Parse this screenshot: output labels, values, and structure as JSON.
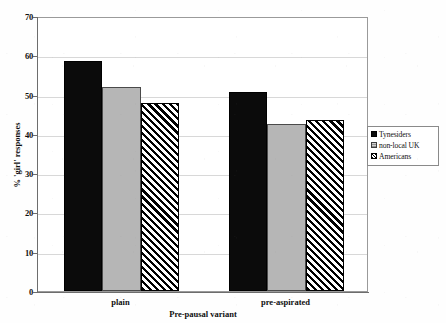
{
  "chart_data": {
    "type": "bar",
    "title": "",
    "subtitle": "",
    "xlabel": "Pre-pausal variant",
    "ylabel": "% 'girl' responses",
    "categories": [
      "plain",
      "pre-aspirated"
    ],
    "series": [
      {
        "name": "Tynesiders",
        "values": [
          58.5,
          50.6
        ],
        "color": "#0b0b0b",
        "fill": "solid-black"
      },
      {
        "name": "non-local UK",
        "values": [
          52.0,
          42.5
        ],
        "color": "#b6b6b6",
        "fill": "solid-gray"
      },
      {
        "name": "Americans",
        "values": [
          47.8,
          43.5
        ],
        "color": "#ffffff",
        "fill": "diagonal-hatch"
      }
    ],
    "ylim": [
      0,
      70
    ],
    "yticks": [
      0,
      10,
      20,
      30,
      40,
      50,
      60,
      70
    ],
    "ytick_labels": [
      "0",
      "10",
      "20",
      "30",
      "40",
      "50",
      "60",
      "70"
    ],
    "grid": true,
    "grid_axis": "y",
    "legend_position": "right",
    "legend_entries": [
      "Tynesiders",
      "non-local UK",
      "Americans"
    ]
  },
  "axes": {
    "y_title": "% 'girl' responses",
    "x_title": "Pre-pausal variant"
  },
  "legend": {
    "items": [
      {
        "label": "Tynesiders"
      },
      {
        "label": "non-local UK"
      },
      {
        "label": "Americans"
      }
    ]
  }
}
